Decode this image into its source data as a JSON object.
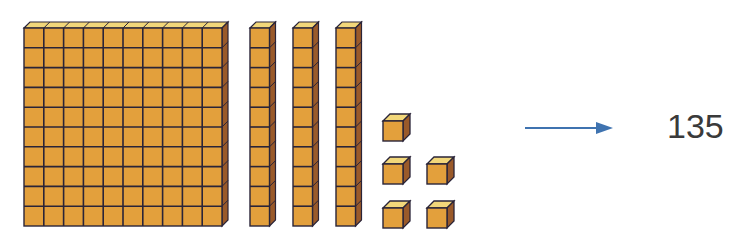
{
  "diagram": {
    "title": "",
    "colors": {
      "front": "#E3A03C",
      "top": "#F2D77A",
      "side": "#9A5A2A",
      "outline": "#2A2438",
      "arrow": "#3F73B0",
      "text": "#3A3A3A"
    },
    "blocks": {
      "hundreds": {
        "count": 1,
        "label": "hundred flat",
        "grid": [
          10,
          10
        ]
      },
      "tens": {
        "count": 3,
        "label": "ten rod",
        "cubes_per_rod": 10
      },
      "ones": {
        "count": 5,
        "label": "unit cube"
      }
    },
    "arrow": {
      "direction": "right"
    },
    "result": {
      "value": "135"
    }
  }
}
